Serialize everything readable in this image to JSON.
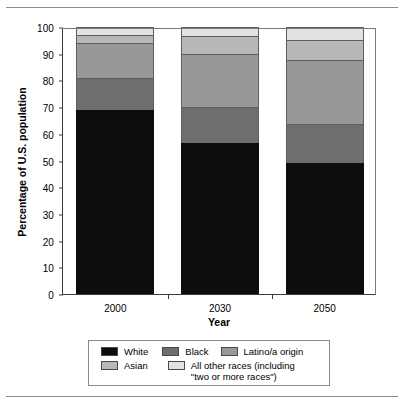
{
  "chart_data": {
    "type": "bar",
    "subtype": "stacked-bar-100-percent",
    "title": "",
    "xlabel": "Year",
    "ylabel": "Percentage of U.S. population",
    "categories": [
      "2000",
      "2030",
      "2050"
    ],
    "ylim": [
      0,
      100
    ],
    "yticks": [
      0,
      10,
      20,
      30,
      40,
      50,
      60,
      70,
      80,
      90,
      100
    ],
    "ytick_labels": [
      "0",
      "10",
      "20",
      "30",
      "40",
      "50",
      "60",
      "70",
      "80",
      "90",
      "100"
    ],
    "grid": false,
    "legend_position": "bottom",
    "series": [
      {
        "name": "White",
        "color": "#0d0d0d",
        "values": [
          69,
          56.5,
          49
        ]
      },
      {
        "name": "Black",
        "color": "#6e6e6e",
        "values": [
          12,
          13.5,
          14.5
        ]
      },
      {
        "name": "Latino/a origin",
        "color": "#989898",
        "values": [
          13,
          20,
          24
        ]
      },
      {
        "name": "Asian",
        "color": "#b8b8b8",
        "values": [
          3,
          6.5,
          7.5
        ]
      },
      {
        "name": "All other races (including \"two or more races\")",
        "color": "#e2e2e2",
        "values": [
          3,
          3.5,
          5
        ]
      }
    ],
    "cumulative_tops": {
      "2000": [
        69,
        81,
        94,
        97,
        100
      ],
      "2030": [
        56.5,
        70,
        90,
        96.5,
        100
      ],
      "2050": [
        49,
        63.5,
        87.5,
        95,
        100
      ]
    }
  },
  "legend": {
    "row1": [
      {
        "label": "White",
        "color": "#0d0d0d"
      },
      {
        "label": "Black",
        "color": "#6e6e6e"
      },
      {
        "label": "Latino/a origin",
        "color": "#989898"
      }
    ],
    "row2": [
      {
        "label": "Asian",
        "color": "#b8b8b8"
      },
      {
        "label": "All other races (including\n\"two or more races\")",
        "color": "#e2e2e2"
      }
    ]
  }
}
